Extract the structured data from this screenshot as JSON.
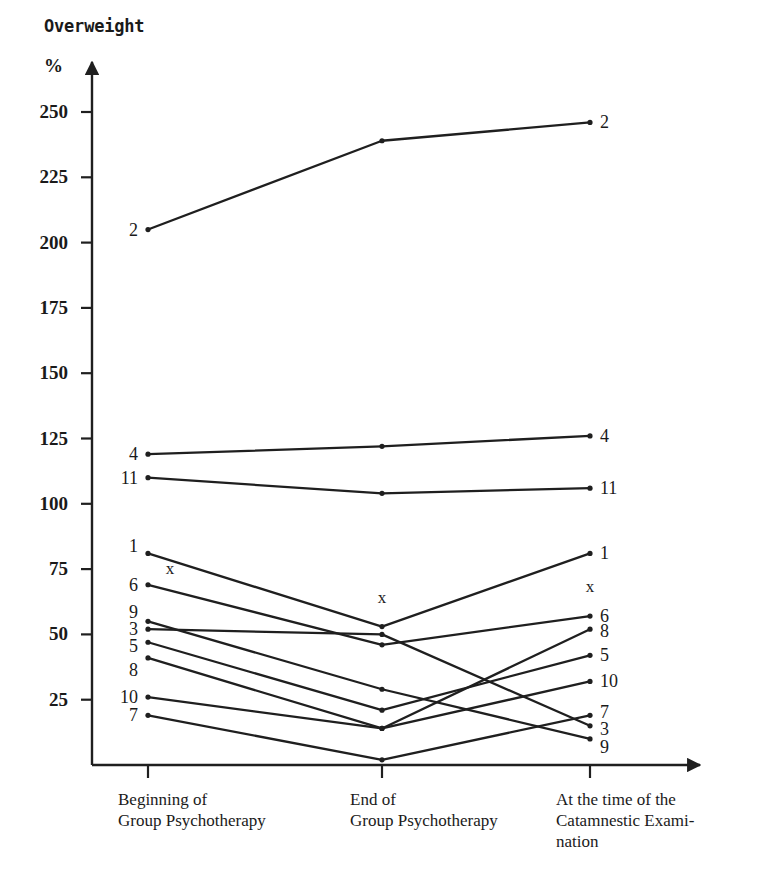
{
  "chart": {
    "title": "Overweight",
    "unit_label": "%",
    "axis_color": "#1a1a1a",
    "line_color": "#1f1f1f"
  },
  "chart_data": {
    "type": "line",
    "title": "Overweight",
    "xlabel": "",
    "ylabel": "%",
    "ylim": [
      0,
      265
    ],
    "yticks": [
      25,
      50,
      75,
      100,
      125,
      150,
      175,
      200,
      225,
      250
    ],
    "ytick_labels": [
      "25",
      "50",
      "75",
      "100",
      "125",
      "150",
      "175",
      "200",
      "225",
      "250"
    ],
    "grid": false,
    "legend": "endpoint-labels",
    "categories": [
      "Beginning of\nGroup Psychotherapy",
      "End of\nGroup Psychotherapy",
      "At the time of the\nCatamnestic Exami-\nnation"
    ],
    "x_positions_px": [
      148,
      382,
      590
    ],
    "series": [
      {
        "name": "2",
        "label_left": "2",
        "label_right": "2",
        "values": [
          205,
          239,
          246
        ]
      },
      {
        "name": "4",
        "label_left": "4",
        "label_right": "4",
        "values": [
          119,
          122,
          126
        ]
      },
      {
        "name": "11",
        "label_left": "11",
        "label_right": "11",
        "values": [
          110,
          104,
          106
        ]
      },
      {
        "name": "1",
        "label_left": "1",
        "label_right": "1",
        "values": [
          81,
          53,
          81
        ]
      },
      {
        "name": "6",
        "label_left": "6",
        "label_right": "6",
        "values": [
          69,
          46,
          57
        ]
      },
      {
        "name": "9",
        "label_left": "9",
        "label_right": "9",
        "values": [
          55,
          29,
          10
        ]
      },
      {
        "name": "3",
        "label_left": "3",
        "label_right": "3",
        "values": [
          52,
          50,
          15
        ]
      },
      {
        "name": "5",
        "label_left": "5",
        "label_right": "5",
        "values": [
          47,
          21,
          42
        ]
      },
      {
        "name": "8",
        "label_left": "8",
        "label_right": "8",
        "values": [
          41,
          14,
          52
        ]
      },
      {
        "name": "10",
        "label_left": "10",
        "label_right": "10",
        "values": [
          26,
          14,
          32
        ]
      },
      {
        "name": "7",
        "label_left": "7",
        "label_right": "7",
        "values": [
          19,
          2,
          19
        ]
      }
    ],
    "annotations": [
      {
        "text": "x",
        "x_index": 0,
        "value": 75
      },
      {
        "text": "x",
        "x_index": 1,
        "value": 64
      },
      {
        "text": "x",
        "x_index": 2,
        "value": 68
      }
    ]
  }
}
